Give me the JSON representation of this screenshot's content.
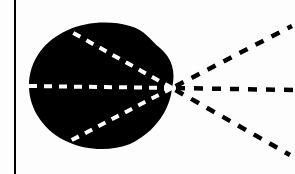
{
  "diagram": {
    "type": "optics-ray-diagram",
    "colors": {
      "background": "#fdfdfd",
      "blob": "#000000",
      "inner_rays": "#ffffff",
      "outer_rays": "#000000",
      "axis_line": "#000000"
    },
    "axis_line": {
      "x": 15,
      "y1": 0,
      "y2": 174
    },
    "apex": {
      "x": 172,
      "y": 88
    },
    "blob_path": "M 68 30 C 85 22, 110 20, 130 26 C 145 30, 150 40, 160 48 C 172 58, 176 72, 172 88 C 170 110, 155 132, 130 144 C 110 152, 85 150, 68 142 C 45 132, 29 110, 29 86 C 29 60, 45 40, 68 30 Z",
    "inner_rays": [
      {
        "name": "upper",
        "x1": 172,
        "y1": 88,
        "x2": 68,
        "y2": 30
      },
      {
        "name": "middle",
        "x1": 172,
        "y1": 88,
        "x2": 29,
        "y2": 86
      },
      {
        "name": "lower",
        "x1": 172,
        "y1": 88,
        "x2": 68,
        "y2": 142
      }
    ],
    "outer_rays": [
      {
        "name": "upper",
        "x1": 172,
        "y1": 88,
        "x2": 292,
        "y2": 26
      },
      {
        "name": "middle",
        "x1": 172,
        "y1": 88,
        "x2": 295,
        "y2": 90
      },
      {
        "name": "lower",
        "x1": 172,
        "y1": 88,
        "x2": 290,
        "y2": 155
      }
    ]
  }
}
